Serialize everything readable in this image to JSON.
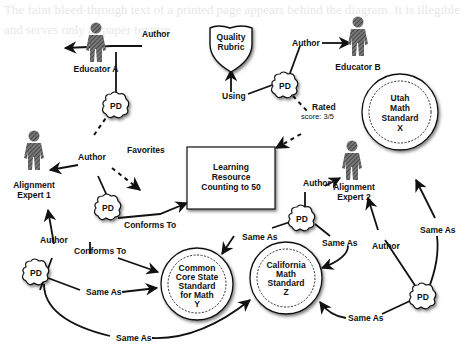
{
  "diagram": {
    "background_text": "The faint bleed-through text of a printed page appears behind the diagram. It is illegible and serves only as paper texture.",
    "nodes": {
      "educator_a": {
        "label": "Educator A",
        "type": "person"
      },
      "educator_b": {
        "label": "Educator B",
        "type": "person"
      },
      "alignment_expert_1": {
        "label_line1": "Alignment",
        "label_line2": "Expert 1",
        "type": "person"
      },
      "alignment_expert_2": {
        "label_line1": "Alignment",
        "label_line2": "Expert 2",
        "type": "person"
      },
      "quality_rubric": {
        "label_line1": "Quality",
        "label_line2": "Rubric",
        "type": "shield"
      },
      "learning_resource": {
        "label_line1": "Learning",
        "label_line2": "Resource",
        "label_line3": "Counting to 50",
        "type": "box"
      },
      "common_core": {
        "label_line1": "Common",
        "label_line2": "Core State",
        "label_line3": "Standard",
        "label_line4": "for Math",
        "label_line5": "Y",
        "type": "seal"
      },
      "california": {
        "label_line1": "California",
        "label_line2": "Math",
        "label_line3": "Standard",
        "label_line4": "Z",
        "type": "seal"
      },
      "utah": {
        "label_line1": "Utah",
        "label_line2": "Math",
        "label_line3": "Standard",
        "label_line4": "X",
        "type": "seal"
      },
      "pd": {
        "label": "PD",
        "type": "cloud"
      }
    },
    "edge_labels": {
      "author": "Author",
      "favorites": "Favorites",
      "using": "Using",
      "rated_line1": "Rated",
      "rated_line2": "score: 3/5",
      "conforms_to": "Conforms To",
      "same_as": "Same As"
    },
    "colors": {
      "ink": "#111111",
      "person_fill": "#555555",
      "background": "#ffffff"
    }
  }
}
